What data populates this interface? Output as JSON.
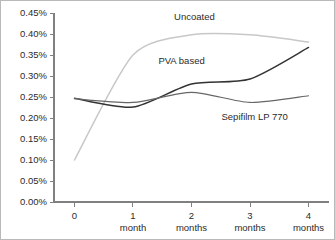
{
  "chart_data": {
    "type": "line",
    "title": "",
    "subtitle": "",
    "xlabel": "",
    "ylabel": "",
    "grid": false,
    "legend_position": "inline-annotations",
    "x": [
      0,
      1,
      2,
      3,
      4
    ],
    "categories": [
      "0",
      "1 month",
      "2 months",
      "3 months",
      "4 months"
    ],
    "x_tick_lines": [
      [
        "0",
        ""
      ],
      [
        "1",
        "month"
      ],
      [
        "2",
        "months"
      ],
      [
        "3",
        "months"
      ],
      [
        "4",
        "months"
      ]
    ],
    "xlim": [
      -0.35,
      4.35
    ],
    "ylim": [
      0.0,
      0.45
    ],
    "y_ticks": [
      0.0,
      0.05,
      0.1,
      0.15,
      0.2,
      0.25,
      0.3,
      0.35,
      0.4,
      0.45
    ],
    "y_tick_labels": [
      "0.00%",
      "0.05%",
      "0.10%",
      "0.15%",
      "0.20%",
      "0.25%",
      "0.30%",
      "0.35%",
      "0.40%",
      "0.45%"
    ],
    "series": [
      {
        "name": "Uncoated",
        "color": "#c8c8c8",
        "width": 1.5,
        "values": [
          0.1,
          0.35,
          0.398,
          0.398,
          0.381
        ],
        "label_x": 2.05,
        "label_y": 0.433
      },
      {
        "name": "PVA based",
        "color": "#333333",
        "width": 1.5,
        "values": [
          0.247,
          0.226,
          0.281,
          0.293,
          0.368
        ],
        "label_x": 1.83,
        "label_y": 0.328
      },
      {
        "name": "Sepifilm LP 770",
        "color": "#666666",
        "width": 1.2,
        "values": [
          0.246,
          0.237,
          0.261,
          0.237,
          0.253
        ],
        "label_x": 3.08,
        "label_y": 0.196
      }
    ]
  },
  "figure": {
    "border_color": "#b9b9b9",
    "background": "#ffffff",
    "axis_color": "#808080",
    "text_color": "#2b2b2b"
  }
}
